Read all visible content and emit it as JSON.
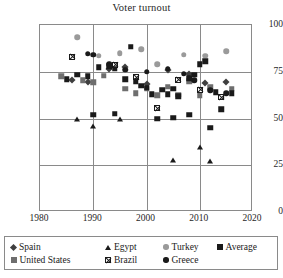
{
  "chart": {
    "title": "Voter turnout"
  },
  "chart_data": {
    "type": "scatter",
    "title": "Voter turnout",
    "xlabel": "",
    "ylabel": "",
    "xlim": [
      1980,
      2020
    ],
    "ylim": [
      0,
      100
    ],
    "xticks": [
      1980,
      1990,
      2000,
      2010,
      2020
    ],
    "yticks": [
      0,
      25,
      50,
      75,
      100
    ],
    "grid": true,
    "legend_position": "bottom",
    "series": [
      {
        "name": "Spain",
        "marker": "diamond",
        "color": "#3f3f3f",
        "points": [
          [
            1986,
            70.5
          ],
          [
            1989,
            69.7
          ],
          [
            1993,
            76.4
          ],
          [
            1996,
            77.4
          ],
          [
            2000,
            68.7
          ],
          [
            2004,
            75.7
          ],
          [
            2008,
            73.9
          ],
          [
            2011,
            68.9
          ],
          [
            2015,
            69.7
          ]
        ]
      },
      {
        "name": "United States",
        "marker": "square",
        "color": "#6e6e6e",
        "points": [
          [
            1984,
            72.5
          ],
          [
            1988,
            70.5
          ],
          [
            1990,
            69.5
          ],
          [
            1992,
            72.8
          ],
          [
            1996,
            66.0
          ],
          [
            1998,
            63.5
          ],
          [
            2000,
            66.0
          ],
          [
            2002,
            62.5
          ],
          [
            2004,
            67.0
          ],
          [
            2006,
            62.8
          ],
          [
            2008,
            70.0
          ],
          [
            2010,
            62.5
          ],
          [
            2012,
            66.8
          ],
          [
            2014,
            61.5
          ],
          [
            2016,
            66.0
          ]
        ]
      },
      {
        "name": "Egypt",
        "marker": "triangle",
        "color": "#1a1a1a",
        "points": [
          [
            1987,
            50.0
          ],
          [
            1990,
            46.0
          ],
          [
            1995,
            49.5
          ],
          [
            2005,
            28.0
          ],
          [
            2010,
            35.0
          ],
          [
            2012,
            27.5
          ]
        ]
      },
      {
        "name": "Brazil",
        "marker": "xsquare",
        "color": "#1a1a1a",
        "points": [
          [
            1986,
            83.0
          ],
          [
            1994,
            82.0
          ],
          [
            1998,
            78.5
          ],
          [
            2002,
            65.0
          ],
          [
            2006,
            83.5
          ],
          [
            2010,
            81.5
          ],
          [
            2014,
            80.5
          ]
        ]
      },
      {
        "name": "Turkey",
        "marker": "circle",
        "color": "#9a9a9a",
        "points": [
          [
            1987,
            93.5
          ],
          [
            1991,
            83.5
          ],
          [
            1995,
            85.0
          ],
          [
            1999,
            87.0
          ],
          [
            2002,
            79.0
          ],
          [
            2007,
            84.0
          ],
          [
            2011,
            83.5
          ],
          [
            2015,
            86.0
          ]
        ]
      },
      {
        "name": "Greece",
        "marker": "circle",
        "color": "#1a1a1a",
        "points": [
          [
            1989,
            84.5
          ],
          [
            1990,
            84.0
          ],
          [
            1993,
            79.0
          ],
          [
            1996,
            76.0
          ],
          [
            2000,
            75.0
          ],
          [
            2004,
            76.5
          ],
          [
            2007,
            74.0
          ],
          [
            2009,
            70.5
          ],
          [
            2012,
            65.0
          ],
          [
            2015,
            63.5
          ]
        ]
      },
      {
        "name": "Average",
        "marker": "square",
        "color": "#1a1a1a",
        "points": [
          [
            1985,
            71.0
          ],
          [
            1987,
            73.5
          ],
          [
            1989,
            72.5
          ],
          [
            1991,
            77.5
          ],
          [
            1993,
            78.0
          ],
          [
            1994,
            76.5
          ],
          [
            1996,
            71.0
          ],
          [
            1997,
            88.5
          ],
          [
            1998,
            70.0
          ],
          [
            1999,
            67.5
          ],
          [
            2000,
            66.5
          ],
          [
            2001,
            63.0
          ],
          [
            2003,
            65.5
          ],
          [
            2004,
            63.0
          ],
          [
            2005,
            66.0
          ],
          [
            2006,
            62.0
          ],
          [
            2008,
            71.5
          ],
          [
            2009,
            73.5
          ],
          [
            2010,
            79.0
          ],
          [
            2011,
            80.5
          ],
          [
            2013,
            64.0
          ],
          [
            2014,
            55.0
          ],
          [
            2016,
            63.5
          ],
          [
            1990,
            52.0
          ],
          [
            1994,
            52.5
          ],
          [
            2002,
            50.0
          ],
          [
            2005,
            50.5
          ],
          [
            2008,
            52.0
          ],
          [
            2012,
            45.0
          ]
        ]
      }
    ]
  },
  "axes": {
    "y_labels": [
      "100",
      "75",
      "50",
      "25",
      "0"
    ],
    "x_labels": [
      "1980",
      "1990",
      "2000",
      "2010",
      "2020"
    ]
  },
  "legend": {
    "items": [
      {
        "label": "Spain",
        "marker": "diamond",
        "color": "#3f3f3f"
      },
      {
        "label": "Egypt",
        "marker": "triangle",
        "color": "#1a1a1a"
      },
      {
        "label": "Turkey",
        "marker": "circle",
        "color": "#9a9a9a"
      },
      {
        "label": "Average",
        "marker": "square",
        "color": "#1a1a1a"
      },
      {
        "label": "United States",
        "marker": "square",
        "color": "#6e6e6e"
      },
      {
        "label": "Brazil",
        "marker": "xsquare",
        "color": "#1a1a1a"
      },
      {
        "label": "Greece",
        "marker": "circle",
        "color": "#1a1a1a"
      }
    ]
  }
}
